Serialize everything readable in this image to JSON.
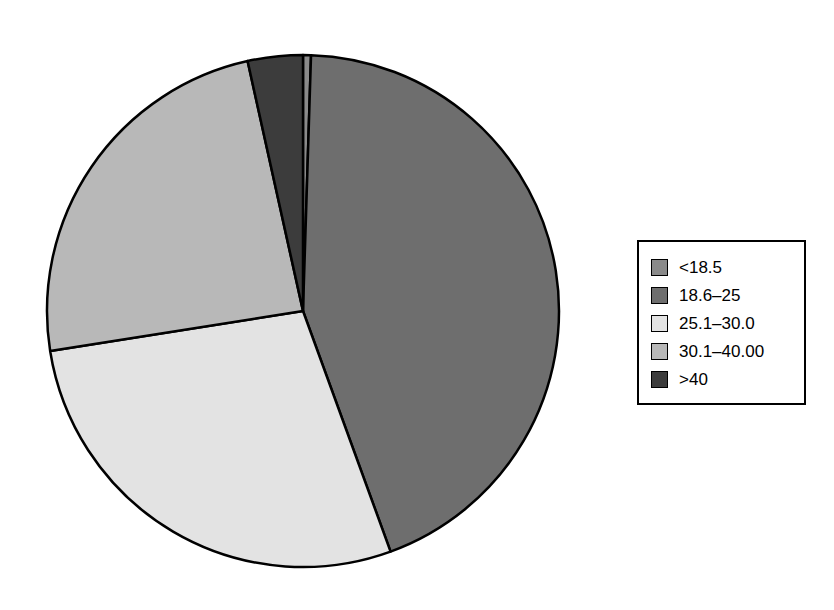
{
  "chart_data": {
    "type": "pie",
    "title": "",
    "subtitle": "",
    "xlabel": "",
    "ylabel": "",
    "grid": false,
    "legend_position": "right",
    "start_angle_deg": 0,
    "direction": "clockwise",
    "center": {
      "x": 303,
      "y": 311
    },
    "radius": 256,
    "categories": [
      "<18.5",
      "18.6–25",
      "25.1–30.0",
      "30.1–40.00",
      ">40"
    ],
    "values": [
      0.5,
      44.0,
      28.0,
      24.0,
      3.5
    ],
    "value_unit": "percent",
    "slices": [
      {
        "label": "<18.5",
        "value": 0.5,
        "start_deg": 0.0,
        "end_deg": 1.8,
        "color": "#8a8a8a"
      },
      {
        "label": "18.6–25",
        "value": 44.0,
        "start_deg": 1.8,
        "end_deg": 160.0,
        "color": "#6e6e6e"
      },
      {
        "label": "25.1–30.0",
        "value": 28.0,
        "start_deg": 160.0,
        "end_deg": 261.0,
        "color": "#e3e3e3"
      },
      {
        "label": "30.1–40.00",
        "value": 24.0,
        "start_deg": 261.0,
        "end_deg": 347.5,
        "color": "#b8b8b8"
      },
      {
        "label": ">40",
        "value": 3.5,
        "start_deg": 347.5,
        "end_deg": 360.0,
        "color": "#3c3c3c"
      }
    ],
    "annotations": []
  },
  "legend": {
    "items": [
      {
        "label": "<18.5",
        "color": "#8a8a8a"
      },
      {
        "label": "18.6–25",
        "color": "#6e6e6e"
      },
      {
        "label": "25.1–30.0",
        "color": "#e3e3e3"
      },
      {
        "label": "30.1–40.00",
        "color": "#b8b8b8"
      },
      {
        "label": ">40",
        "color": "#3c3c3c"
      }
    ]
  },
  "style": {
    "outline_color": "#000000",
    "background": "#ffffff"
  }
}
